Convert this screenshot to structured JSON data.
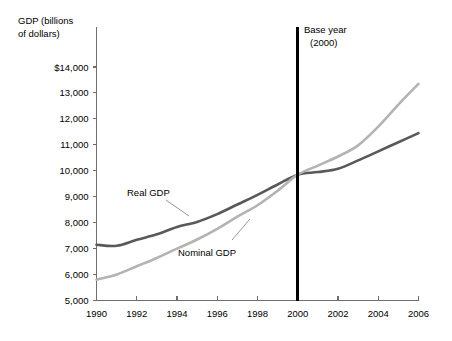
{
  "chart_data": {
    "type": "line",
    "title": "",
    "xlabel": "",
    "ylabel": "GDP (billions of dollars)",
    "ylabel_line1": "GDP (billions",
    "ylabel_line2": "of dollars)",
    "xlim": [
      1990,
      2006
    ],
    "ylim": [
      5000,
      14000
    ],
    "grid": false,
    "legend_position": "inline-annotations",
    "x_tick_labels": [
      "1990",
      "1992",
      "1994",
      "1996",
      "1998",
      "2000",
      "2002",
      "2004",
      "2006"
    ],
    "x_ticks": [
      1990,
      1992,
      1994,
      1996,
      1998,
      2000,
      2002,
      2004,
      2006
    ],
    "y_ticks": [
      5000,
      6000,
      7000,
      8000,
      9000,
      10000,
      11000,
      12000,
      13000,
      14000
    ],
    "y_tick_labels": [
      "5,000",
      "6,000",
      "7,000",
      "8,000",
      "9,000",
      "10,000",
      "11,000",
      "12,000",
      "13,000",
      "$14,000"
    ],
    "x": [
      1990,
      1991,
      1992,
      1993,
      1994,
      1995,
      1996,
      1997,
      1998,
      1999,
      2000,
      2001,
      2002,
      2003,
      2004,
      2005,
      2006
    ],
    "series": [
      {
        "name": "Real GDP",
        "color": "#595959",
        "width": 2.6,
        "values": [
          7150,
          7110,
          7340,
          7550,
          7830,
          8030,
          8330,
          8700,
          9070,
          9470,
          9850,
          9950,
          10080,
          10400,
          10750,
          11100,
          11450
        ]
      },
      {
        "name": "Nominal GDP",
        "color": "#b3b3b3",
        "width": 2.6,
        "values": [
          5800,
          6000,
          6320,
          6640,
          7000,
          7350,
          7760,
          8230,
          8670,
          9230,
          9850,
          10200,
          10550,
          10980,
          11700,
          12550,
          13350
        ]
      }
    ],
    "annotations": [
      {
        "name": "base-year",
        "line1": "Base year",
        "line2": "(2000)",
        "at_x": 2000,
        "color": "#000000"
      }
    ],
    "series_labels": [
      {
        "name": "Real GDP",
        "text": "Real GDP"
      },
      {
        "name": "Nominal GDP",
        "text": "Nominal GDP"
      }
    ]
  }
}
